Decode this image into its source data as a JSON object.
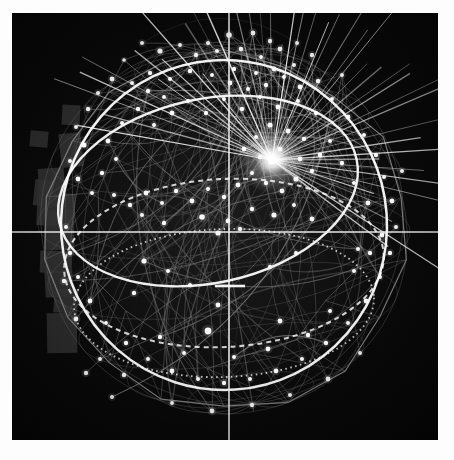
{
  "app": {
    "title": "Global Network Visualization",
    "frame": {
      "x": 12,
      "y": 13,
      "width": 426,
      "height": 427
    },
    "background_color": "#fdfdfd",
    "canvas_color": "#070707"
  },
  "palette": {
    "background": "#070707",
    "wireframe_dim": "#6e6e6e",
    "wireframe_mid": "#9a9a9a",
    "wireframe_bright": "#ffffff",
    "node_color": "#ffffff",
    "crosshair_color": "#f2f2f2",
    "landmass_color": "#303030",
    "hub_glow": "#ffffff"
  },
  "crosshair": {
    "vertical_x": 217,
    "horizontal_y": 219,
    "tick": {
      "x1": 203,
      "x2": 233,
      "y": 273
    },
    "line_width": 1.6
  },
  "globe": {
    "center_x": 212,
    "center_y": 215,
    "radius": 186,
    "outer_polygon_sides": 18,
    "meridian_count": 14,
    "parallel_count": 9,
    "label": "wireframe-globe"
  },
  "great_circles": [
    {
      "name": "primary-equatorial-ring",
      "cx": 212,
      "cy": 212,
      "rx": 163,
      "ry": 165,
      "rotation": -4,
      "brightness": 1.0
    },
    {
      "name": "tilted-orbit-ring",
      "cx": 196,
      "cy": 178,
      "rx": 152,
      "ry": 92,
      "rotation": -12,
      "brightness": 0.95
    },
    {
      "name": "lower-dashed-ring",
      "cx": 212,
      "cy": 250,
      "rx": 160,
      "ry": 84,
      "rotation": -3,
      "brightness": 0.7
    },
    {
      "name": "lower-dotted-ring",
      "cx": 212,
      "cy": 290,
      "rx": 150,
      "ry": 74,
      "rotation": -2,
      "brightness": 0.55
    }
  ],
  "hub": {
    "name": "radiating-connection-hub",
    "x": 260,
    "y": 147,
    "ray_count": 46,
    "glow_radius": 34,
    "label": "active-node-hub"
  },
  "landmass_blocks": [
    {
      "x": 27,
      "y": 155,
      "w": 26,
      "h": 40,
      "angle": -4
    },
    {
      "x": 25,
      "y": 180,
      "w": 38,
      "h": 33,
      "angle": 3
    },
    {
      "x": 32,
      "y": 197,
      "w": 30,
      "h": 40,
      "angle": -2
    },
    {
      "x": 22,
      "y": 167,
      "w": 20,
      "h": 26,
      "angle": 6
    },
    {
      "x": 28,
      "y": 238,
      "w": 32,
      "h": 22,
      "angle": 2
    },
    {
      "x": 33,
      "y": 258,
      "w": 28,
      "h": 26,
      "angle": -3
    },
    {
      "x": 42,
      "y": 276,
      "w": 24,
      "h": 24,
      "angle": 4
    },
    {
      "x": 35,
      "y": 300,
      "w": 30,
      "h": 40,
      "angle": -1
    },
    {
      "x": 18,
      "y": 118,
      "w": 18,
      "h": 16,
      "angle": 5
    },
    {
      "x": 48,
      "y": 120,
      "w": 22,
      "h": 34,
      "angle": -6
    },
    {
      "x": 50,
      "y": 92,
      "w": 18,
      "h": 20,
      "angle": 3
    }
  ],
  "nodes": [
    {
      "x": 217,
      "y": 22,
      "r": 2.8
    },
    {
      "x": 196,
      "y": 30,
      "r": 2.0
    },
    {
      "x": 241,
      "y": 20,
      "r": 2.4
    },
    {
      "x": 258,
      "y": 28,
      "r": 2.2
    },
    {
      "x": 168,
      "y": 32,
      "r": 2.0
    },
    {
      "x": 148,
      "y": 38,
      "r": 2.6
    },
    {
      "x": 130,
      "y": 30,
      "r": 2.0
    },
    {
      "x": 112,
      "y": 47,
      "r": 1.8
    },
    {
      "x": 184,
      "y": 42,
      "r": 2.2
    },
    {
      "x": 205,
      "y": 38,
      "r": 2.0
    },
    {
      "x": 229,
      "y": 36,
      "r": 2.3
    },
    {
      "x": 249,
      "y": 44,
      "r": 2.0
    },
    {
      "x": 268,
      "y": 36,
      "r": 2.4
    },
    {
      "x": 285,
      "y": 30,
      "r": 2.0
    },
    {
      "x": 300,
      "y": 42,
      "r": 2.2
    },
    {
      "x": 282,
      "y": 52,
      "r": 2.0
    },
    {
      "x": 262,
      "y": 56,
      "r": 2.4
    },
    {
      "x": 244,
      "y": 60,
      "r": 2.0
    },
    {
      "x": 222,
      "y": 56,
      "r": 2.2
    },
    {
      "x": 200,
      "y": 62,
      "r": 2.0
    },
    {
      "x": 178,
      "y": 58,
      "r": 2.3
    },
    {
      "x": 158,
      "y": 66,
      "r": 2.0
    },
    {
      "x": 138,
      "y": 60,
      "r": 2.2
    },
    {
      "x": 120,
      "y": 70,
      "r": 2.0
    },
    {
      "x": 100,
      "y": 66,
      "r": 2.4
    },
    {
      "x": 86,
      "y": 80,
      "r": 2.0
    },
    {
      "x": 76,
      "y": 96,
      "r": 2.2
    },
    {
      "x": 64,
      "y": 114,
      "r": 2.0
    },
    {
      "x": 72,
      "y": 132,
      "r": 2.6
    },
    {
      "x": 58,
      "y": 148,
      "r": 2.0
    },
    {
      "x": 66,
      "y": 166,
      "r": 2.4
    },
    {
      "x": 80,
      "y": 180,
      "r": 2.0
    },
    {
      "x": 90,
      "y": 160,
      "r": 2.2
    },
    {
      "x": 104,
      "y": 146,
      "r": 2.0
    },
    {
      "x": 96,
      "y": 128,
      "r": 2.4
    },
    {
      "x": 110,
      "y": 110,
      "r": 2.0
    },
    {
      "x": 126,
      "y": 96,
      "r": 2.2
    },
    {
      "x": 142,
      "y": 112,
      "r": 2.0
    },
    {
      "x": 160,
      "y": 100,
      "r": 2.4
    },
    {
      "x": 176,
      "y": 88,
      "r": 2.0
    },
    {
      "x": 194,
      "y": 100,
      "r": 2.2
    },
    {
      "x": 212,
      "y": 86,
      "r": 2.0
    },
    {
      "x": 230,
      "y": 96,
      "r": 2.3
    },
    {
      "x": 248,
      "y": 84,
      "r": 2.0
    },
    {
      "x": 266,
      "y": 94,
      "r": 2.4
    },
    {
      "x": 286,
      "y": 88,
      "r": 2.0
    },
    {
      "x": 304,
      "y": 100,
      "r": 2.2
    },
    {
      "x": 320,
      "y": 86,
      "r": 2.0
    },
    {
      "x": 336,
      "y": 104,
      "r": 2.4
    },
    {
      "x": 352,
      "y": 122,
      "r": 2.0
    },
    {
      "x": 364,
      "y": 142,
      "r": 2.2
    },
    {
      "x": 372,
      "y": 164,
      "r": 2.0
    },
    {
      "x": 380,
      "y": 188,
      "r": 2.4
    },
    {
      "x": 384,
      "y": 214,
      "r": 2.0
    },
    {
      "x": 378,
      "y": 240,
      "r": 2.2
    },
    {
      "x": 368,
      "y": 264,
      "r": 2.0
    },
    {
      "x": 354,
      "y": 288,
      "r": 2.4
    },
    {
      "x": 336,
      "y": 310,
      "r": 2.0
    },
    {
      "x": 314,
      "y": 330,
      "r": 2.2
    },
    {
      "x": 290,
      "y": 346,
      "r": 2.0
    },
    {
      "x": 264,
      "y": 358,
      "r": 2.4
    },
    {
      "x": 238,
      "y": 366,
      "r": 2.0
    },
    {
      "x": 212,
      "y": 370,
      "r": 2.2
    },
    {
      "x": 186,
      "y": 366,
      "r": 2.0
    },
    {
      "x": 160,
      "y": 358,
      "r": 2.4
    },
    {
      "x": 136,
      "y": 346,
      "r": 2.0
    },
    {
      "x": 114,
      "y": 330,
      "r": 2.2
    },
    {
      "x": 94,
      "y": 310,
      "r": 2.0
    },
    {
      "x": 78,
      "y": 288,
      "r": 2.4
    },
    {
      "x": 66,
      "y": 264,
      "r": 2.0
    },
    {
      "x": 58,
      "y": 240,
      "r": 2.2
    },
    {
      "x": 54,
      "y": 214,
      "r": 2.0
    },
    {
      "x": 258,
      "y": 112,
      "r": 2.6
    },
    {
      "x": 276,
      "y": 118,
      "r": 2.4
    },
    {
      "x": 292,
      "y": 126,
      "r": 2.2
    },
    {
      "x": 244,
      "y": 124,
      "r": 2.0
    },
    {
      "x": 232,
      "y": 136,
      "r": 2.4
    },
    {
      "x": 248,
      "y": 144,
      "r": 2.2
    },
    {
      "x": 268,
      "y": 136,
      "r": 2.6
    },
    {
      "x": 288,
      "y": 146,
      "r": 2.4
    },
    {
      "x": 300,
      "y": 158,
      "r": 2.2
    },
    {
      "x": 284,
      "y": 166,
      "r": 2.6
    },
    {
      "x": 270,
      "y": 178,
      "r": 2.4
    },
    {
      "x": 254,
      "y": 170,
      "r": 2.2
    },
    {
      "x": 240,
      "y": 160,
      "r": 2.0
    },
    {
      "x": 226,
      "y": 172,
      "r": 2.4
    },
    {
      "x": 212,
      "y": 184,
      "r": 2.2
    },
    {
      "x": 196,
      "y": 176,
      "r": 2.0
    },
    {
      "x": 180,
      "y": 188,
      "r": 2.4
    },
    {
      "x": 164,
      "y": 178,
      "r": 2.2
    },
    {
      "x": 150,
      "y": 190,
      "r": 2.0
    },
    {
      "x": 134,
      "y": 180,
      "r": 2.4
    },
    {
      "x": 118,
      "y": 192,
      "r": 2.2
    },
    {
      "x": 102,
      "y": 182,
      "r": 2.0
    },
    {
      "x": 308,
      "y": 142,
      "r": 2.4
    },
    {
      "x": 318,
      "y": 128,
      "r": 2.0
    },
    {
      "x": 330,
      "y": 150,
      "r": 2.2
    },
    {
      "x": 342,
      "y": 170,
      "r": 2.0
    },
    {
      "x": 356,
      "y": 190,
      "r": 2.4
    },
    {
      "x": 190,
      "y": 204,
      "r": 2.8
    },
    {
      "x": 216,
      "y": 208,
      "r": 2.4
    },
    {
      "x": 240,
      "y": 196,
      "r": 2.2
    },
    {
      "x": 262,
      "y": 202,
      "r": 2.6
    },
    {
      "x": 282,
      "y": 192,
      "r": 2.0
    },
    {
      "x": 300,
      "y": 206,
      "r": 2.4
    },
    {
      "x": 152,
      "y": 210,
      "r": 2.2
    },
    {
      "x": 130,
      "y": 202,
      "r": 2.0
    },
    {
      "x": 206,
      "y": 220,
      "r": 2.6
    },
    {
      "x": 228,
      "y": 216,
      "r": 2.2
    },
    {
      "x": 370,
      "y": 222,
      "r": 2.4
    },
    {
      "x": 346,
      "y": 236,
      "r": 2.0
    },
    {
      "x": 132,
      "y": 248,
      "r": 2.6
    },
    {
      "x": 156,
      "y": 258,
      "r": 2.0
    },
    {
      "x": 206,
      "y": 292,
      "r": 2.4
    },
    {
      "x": 196,
      "y": 318,
      "r": 3.4
    },
    {
      "x": 122,
      "y": 280,
      "r": 2.2
    },
    {
      "x": 64,
      "y": 306,
      "r": 2.4
    },
    {
      "x": 296,
      "y": 322,
      "r": 2.2
    },
    {
      "x": 318,
      "y": 298,
      "r": 2.0
    },
    {
      "x": 256,
      "y": 336,
      "r": 2.4
    },
    {
      "x": 88,
      "y": 346,
      "r": 2.0
    },
    {
      "x": 112,
      "y": 362,
      "r": 2.2
    },
    {
      "x": 222,
      "y": 344,
      "r": 2.0
    },
    {
      "x": 268,
      "y": 308,
      "r": 2.4
    },
    {
      "x": 342,
      "y": 258,
      "r": 2.0
    },
    {
      "x": 358,
      "y": 240,
      "r": 2.2
    },
    {
      "x": 284,
      "y": 240,
      "r": 2.0
    },
    {
      "x": 258,
      "y": 254,
      "r": 2.2
    },
    {
      "x": 178,
      "y": 272,
      "r": 2.0
    },
    {
      "x": 148,
      "y": 324,
      "r": 2.2
    },
    {
      "x": 172,
      "y": 340,
      "r": 2.0
    },
    {
      "x": 200,
      "y": 398,
      "r": 2.4
    },
    {
      "x": 160,
      "y": 390,
      "r": 2.0
    },
    {
      "x": 240,
      "y": 392,
      "r": 2.2
    },
    {
      "x": 278,
      "y": 382,
      "r": 2.0
    },
    {
      "x": 316,
      "y": 366,
      "r": 2.4
    },
    {
      "x": 100,
      "y": 384,
      "r": 2.0
    },
    {
      "x": 74,
      "y": 360,
      "r": 2.2
    },
    {
      "x": 348,
      "y": 340,
      "r": 2.0
    },
    {
      "x": 52,
      "y": 268,
      "r": 2.2
    },
    {
      "x": 390,
      "y": 158,
      "r": 2.0
    },
    {
      "x": 306,
      "y": 68,
      "r": 2.2
    },
    {
      "x": 330,
      "y": 62,
      "r": 2.0
    },
    {
      "x": 288,
      "y": 74,
      "r": 2.4
    },
    {
      "x": 272,
      "y": 64,
      "r": 2.0
    },
    {
      "x": 254,
      "y": 72,
      "r": 2.2
    },
    {
      "x": 236,
      "y": 76,
      "r": 2.0
    },
    {
      "x": 218,
      "y": 70,
      "r": 2.4
    },
    {
      "x": 152,
      "y": 84,
      "r": 2.0
    },
    {
      "x": 136,
      "y": 78,
      "r": 2.2
    }
  ],
  "legend": {
    "visible": false
  }
}
